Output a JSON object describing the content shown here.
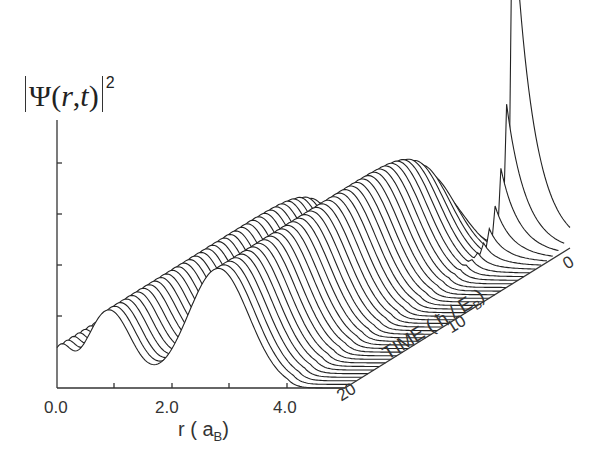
{
  "chart_data": {
    "type": "waterfall_3d_line",
    "title": "",
    "ylabel": "|Ψ(r,t)|²",
    "xlabel": "r ( a_B )",
    "xlabel_main": "r ( a",
    "xlabel_sub": "B",
    "xlabel_close": ")",
    "zlabel": "TIME ( ħ / E_B )",
    "zlabel_main": "TIME ( ħ / E",
    "zlabel_sub": "B",
    "zlabel_close": ")",
    "x_ticks": [
      "0.0",
      "2.0",
      "4.0"
    ],
    "x_range": [
      0,
      5
    ],
    "time_ticks": [
      "0",
      "10",
      "20"
    ],
    "time_range": [
      0,
      20
    ],
    "y_ticks_count": 4,
    "y_tick_labels": [],
    "num_slices": 40,
    "slices_sample": [
      {
        "t": 0,
        "peak_r": 4.0,
        "peak_height": 1.0
      },
      {
        "t": 0.5,
        "peak_r": 4.0,
        "peak_height": 0.82
      },
      {
        "t": 1.0,
        "peak_r": 4.0,
        "peak_height": 0.55
      },
      {
        "t": 1.5,
        "peak_r": 4.0,
        "peak_height": 0.3
      },
      {
        "t": 2.0,
        "peak_r": 4.0,
        "peak_height": 0.12
      },
      {
        "t": 20,
        "humps": [
          {
            "r": 0.9,
            "height": 0.33
          },
          {
            "r": 2.8,
            "height": 0.5
          }
        ]
      }
    ],
    "grid": false,
    "legend": null
  },
  "axes": {
    "ylabel_psi": "Ψ(",
    "ylabel_r": "r",
    "ylabel_comma": ",",
    "ylabel_t": "t",
    "ylabel_close": ")",
    "ylabel_power": "2"
  }
}
